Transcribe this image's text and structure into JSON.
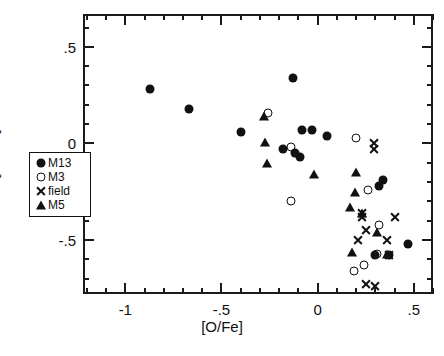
{
  "chart_data": {
    "type": "scatter",
    "title": "",
    "xlabel": "[O/Fe]",
    "ylabel": "[Na/Fe]",
    "xlim": [
      -1.22,
      0.6
    ],
    "ylim": [
      -0.78,
      0.67
    ],
    "xticks_major": [
      -1,
      -0.5,
      0,
      0.5
    ],
    "xtick_labels": [
      "-1",
      "-.5",
      "0",
      ".5"
    ],
    "yticks_major": [
      0.5,
      0,
      -0.5
    ],
    "ytick_labels": [
      ".5",
      "0",
      "-.5"
    ],
    "minor_tick_step": 0.1,
    "grid": false,
    "legend_position": "lower-left-inside",
    "series": [
      {
        "name": "M13",
        "marker": "filled-circle",
        "points": [
          [
            -0.88,
            0.29
          ],
          [
            -0.68,
            0.19
          ],
          [
            -0.41,
            0.07
          ],
          [
            -0.14,
            0.35
          ],
          [
            -0.09,
            0.08
          ],
          [
            -0.04,
            0.08
          ],
          [
            -0.19,
            -0.02
          ],
          [
            -0.13,
            -0.04
          ],
          [
            -0.1,
            -0.06
          ],
          [
            0.04,
            0.05
          ],
          [
            0.33,
            -0.18
          ],
          [
            0.31,
            -0.21
          ],
          [
            0.29,
            -0.57
          ],
          [
            0.46,
            -0.51
          ],
          [
            0.36,
            -0.57
          ]
        ]
      },
      {
        "name": "M3",
        "marker": "open-circle",
        "points": [
          [
            -0.27,
            0.17
          ],
          [
            -0.15,
            -0.29
          ],
          [
            -0.15,
            -0.01
          ],
          [
            0.19,
            0.04
          ],
          [
            0.31,
            -0.41
          ],
          [
            0.25,
            -0.23
          ],
          [
            0.3,
            -0.56
          ],
          [
            0.23,
            -0.62
          ],
          [
            0.18,
            -0.65
          ]
        ]
      },
      {
        "name": "field",
        "marker": "cross",
        "points": [
          [
            0.28,
            -0.02
          ],
          [
            0.28,
            0.01
          ],
          [
            0.22,
            -0.35
          ],
          [
            0.24,
            -0.44
          ],
          [
            0.2,
            -0.49
          ],
          [
            0.22,
            -0.37
          ],
          [
            0.39,
            -0.37
          ],
          [
            0.35,
            -0.49
          ],
          [
            0.36,
            -0.57
          ],
          [
            0.55,
            -0.82
          ],
          [
            0.24,
            -0.72
          ],
          [
            0.03,
            -1.15
          ],
          [
            0.34,
            -1.09
          ],
          [
            0.38,
            -1.17
          ],
          [
            0.29,
            -0.73
          ]
        ]
      },
      {
        "name": "M5",
        "marker": "filled-triangle",
        "points": [
          [
            -0.29,
            0.15
          ],
          [
            -0.285,
            0.02
          ],
          [
            -0.275,
            -0.09
          ],
          [
            -0.03,
            -0.15
          ],
          [
            0.19,
            -0.14
          ],
          [
            0.185,
            -0.24
          ],
          [
            0.16,
            -0.32
          ],
          [
            0.22,
            -0.35
          ],
          [
            0.3,
            -0.45
          ],
          [
            0.17,
            -0.55
          ],
          [
            0.35,
            -0.56
          ]
        ]
      }
    ],
    "legend_entries": [
      {
        "label": "M13",
        "marker": "filled-circle"
      },
      {
        "label": "M3",
        "marker": "open-circle"
      },
      {
        "label": "field",
        "marker": "cross"
      },
      {
        "label": "M5",
        "marker": "filled-triangle"
      }
    ]
  }
}
